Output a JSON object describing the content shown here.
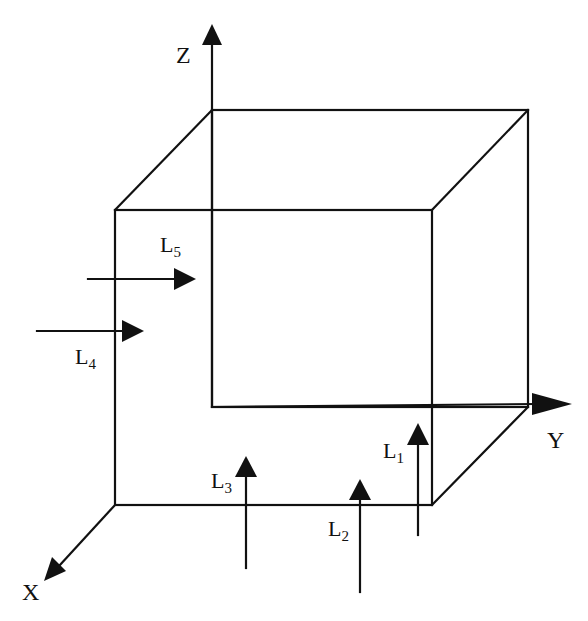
{
  "diagram": {
    "type": "3D cube with coordinate axes and incident light beams",
    "colors": {
      "line": "#111111",
      "background": "#ffffff"
    },
    "axes": {
      "x": {
        "label": "X"
      },
      "y": {
        "label": "Y"
      },
      "z": {
        "label": "Z"
      }
    },
    "beams": [
      {
        "id": "L1",
        "base": "L",
        "sub": "1",
        "direction": "up (+Z)"
      },
      {
        "id": "L2",
        "base": "L",
        "sub": "2",
        "direction": "up (+Z)"
      },
      {
        "id": "L3",
        "base": "L",
        "sub": "3",
        "direction": "up (+Z)"
      },
      {
        "id": "L4",
        "base": "L",
        "sub": "4",
        "direction": "right (+Y)"
      },
      {
        "id": "L5",
        "base": "L",
        "sub": "5",
        "direction": "right (+Y)"
      }
    ]
  }
}
